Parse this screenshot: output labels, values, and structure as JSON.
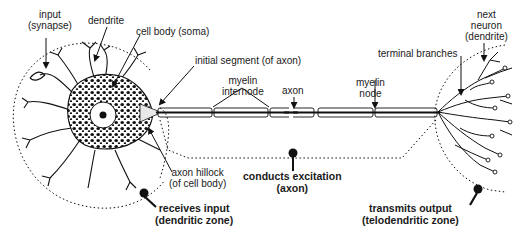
{
  "diagram": {
    "labels": {
      "input": [
        "input",
        "(synapse)"
      ],
      "dendrite": "dendrite",
      "cell_body": "cell body (soma)",
      "initial_segment": "initial segment (of axon)",
      "myelin_internode": [
        "myelin",
        "internode"
      ],
      "axon": "axon",
      "myelin_node": [
        "myelin",
        "node"
      ],
      "terminal_branches": "terminal branches",
      "next_neuron": [
        "next",
        "neuron",
        "(dendrite)"
      ],
      "axon_hillock": [
        "axon hillock",
        "(of cell body)"
      ]
    },
    "zones": {
      "dendritic": [
        "receives input",
        "(dendritic zone)"
      ],
      "axon": [
        "conducts excitation",
        "(axon)"
      ],
      "telodendritic": [
        "transmits output",
        "(telodendritic zone)"
      ]
    },
    "colors": {
      "ink": "#111111",
      "background": "#ffffff"
    }
  }
}
